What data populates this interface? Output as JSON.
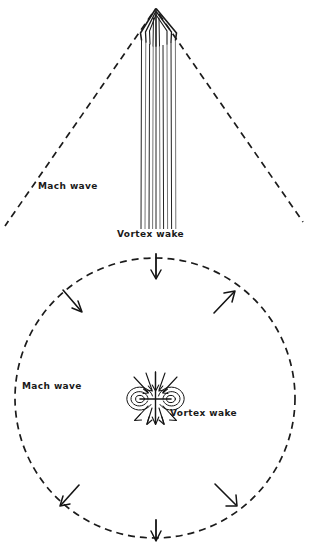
{
  "figure": {
    "background_color": "#ffffff",
    "ink_color": "#1b1b1b",
    "width": 309,
    "height": 546
  },
  "panels": [
    {
      "id": "plan-view",
      "name": "plan-view-panel",
      "description": "V-shaped Mach wave with narrow vortex wake trailing from apex",
      "apex": {
        "x": 155,
        "y": 10
      },
      "mach_wave": {
        "left_end": {
          "x": 5,
          "y": 226
        },
        "right_end": {
          "x": 303,
          "y": 222
        },
        "style": "dashed"
      },
      "vortex_wake": {
        "top_y": 14,
        "bottom_y": 229,
        "left_x": 141,
        "right_x": 176,
        "line_count": 8
      },
      "labels": {
        "mach_wave": "Mach wave",
        "vortex_wake": "Vortex wake"
      },
      "label_positions": {
        "mach_wave": {
          "x": 38,
          "y": 189
        },
        "vortex_wake": {
          "x": 117,
          "y": 237
        }
      }
    },
    {
      "id": "cross-section-view",
      "name": "cross-section-panel",
      "description": "Dashed circular Mach wave with counter-rotating vortex pair at center",
      "circle": {
        "center": {
          "x": 155,
          "y": 398
        },
        "radius": 140,
        "style": "dashed"
      },
      "labels": {
        "mach_wave": "Mach wave",
        "vortex_wake": "Vortex wake"
      },
      "label_positions": {
        "mach_wave": {
          "x": 22,
          "y": 389
        },
        "vortex_wake": {
          "x": 170,
          "y": 416
        }
      },
      "arrows": [
        {
          "name": "arrow-top",
          "angle_deg": 270,
          "direction": "inward",
          "label": "top"
        },
        {
          "name": "arrow-upper-left",
          "angle_deg": 215,
          "direction": "inward",
          "label": "upper-left"
        },
        {
          "name": "arrow-upper-right",
          "angle_deg": 325,
          "direction": "outward",
          "label": "upper-right"
        },
        {
          "name": "arrow-lower-left",
          "angle_deg": 145,
          "direction": "outward",
          "label": "lower-left"
        },
        {
          "name": "arrow-lower-right",
          "angle_deg": 35,
          "direction": "outward",
          "label": "lower-right"
        },
        {
          "name": "arrow-bottom",
          "angle_deg": 90,
          "direction": "outward",
          "label": "bottom"
        }
      ],
      "vortex_pair": {
        "center": {
          "x": 155,
          "y": 398
        },
        "core_left": {
          "x": 140,
          "y": 399
        },
        "core_right": {
          "x": 171,
          "y": 399
        },
        "core_count": 2,
        "rotation": "counter-rotating",
        "streamline_arrow_count": 8
      }
    }
  ]
}
